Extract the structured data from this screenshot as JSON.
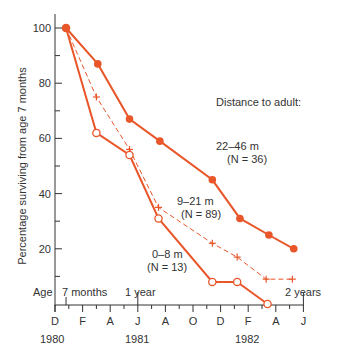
{
  "chart_data": {
    "type": "line",
    "title": "",
    "xlabel": "",
    "ylabel": "Percentage surviving from age 7 months",
    "ylim": [
      0,
      100
    ],
    "yticks": [
      20,
      40,
      60,
      80,
      100
    ],
    "grid": false,
    "legend_title": "Distance to adult:",
    "x_month_labels": [
      "D",
      "F",
      "A",
      "J",
      "A",
      "O",
      "D",
      "F",
      "A",
      "J"
    ],
    "x_year_labels": [
      {
        "label": "1980",
        "month_index": 0
      },
      {
        "label": "1981",
        "month_index": 6
      },
      {
        "label": "1982",
        "month_index": 14
      }
    ],
    "age_labels": [
      {
        "label": "Age",
        "month_index": -1
      },
      {
        "label": "7 months",
        "month_index": 0.8
      },
      {
        "label": "1 year",
        "month_index": 6
      },
      {
        "label": "2 years",
        "month_index": 18
      }
    ],
    "x_unit": "months since Dec 1979",
    "series": [
      {
        "name": "22–46 m",
        "n_label": "(N = 36)",
        "marker": "filled-circle",
        "line": "solid",
        "x": [
          0.8,
          3.1,
          5.4,
          7.6,
          11.4,
          13.4,
          15.5,
          17.3
        ],
        "values": [
          100,
          87,
          67,
          59,
          45,
          31,
          25,
          20
        ]
      },
      {
        "name": "9–21 m",
        "n_label": "(N = 89)",
        "marker": "cross",
        "line": "dashed",
        "x": [
          0.8,
          3.0,
          5.4,
          7.5,
          11.4,
          13.2,
          15.3,
          17.2
        ],
        "values": [
          100,
          75,
          56,
          35,
          22,
          17,
          9,
          9
        ]
      },
      {
        "name": "0–8 m",
        "n_label": "(N = 13)",
        "marker": "open-circle",
        "line": "solid",
        "x": [
          0.8,
          3.0,
          5.4,
          7.5,
          11.4,
          13.2,
          15.4
        ],
        "values": [
          100,
          62,
          54,
          31,
          8,
          8,
          0
        ]
      }
    ],
    "colors": {
      "series": "#e8562a",
      "axis": "#333333"
    }
  },
  "labels": {
    "legend_title": "Distance to adult:",
    "s1_name": "22–46 m",
    "s1_n": "(N = 36)",
    "s2_name": "9–21 m",
    "s2_n": "(N = 89)",
    "s3_name": "0–8 m",
    "s3_n": "(N = 13)",
    "ylabel": "Percentage surviving from age 7 months",
    "age": "Age",
    "age_7m": "7 months",
    "age_1y": "1 year",
    "age_2y": "2 years",
    "y1980": "1980",
    "y1981": "1981",
    "y1982": "1982"
  }
}
